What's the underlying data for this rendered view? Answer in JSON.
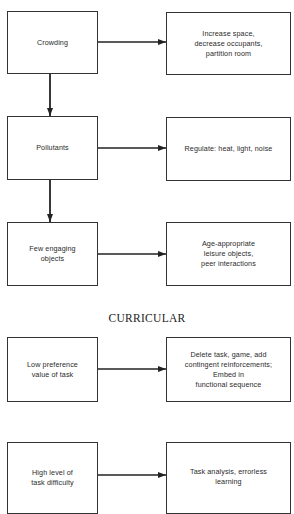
{
  "diagram": {
    "section_heading": "CURRICULAR",
    "environmental_rows": [
      {
        "problem": "Crowding",
        "intervention": "Increase space,\ndecrease occupants,\npartition room"
      },
      {
        "problem": "Pollutants",
        "intervention": "Regulate:  heat, light, noise"
      },
      {
        "problem": "Few engaging\nobjects",
        "intervention": "Age-appropriate\nleisure objects,\npeer interactions"
      }
    ],
    "curricular_rows": [
      {
        "problem": "Low preference\nvalue of task",
        "intervention": "Delete task, game, add\ncontingent reinforcements;\nEmbed in\nfunctional sequence"
      },
      {
        "problem": "High level of\ntask difficulty",
        "intervention": "Task analysis, errorless\nlearning"
      }
    ],
    "colors": {
      "line": "#222222",
      "border": "#333333",
      "background": "#ffffff"
    }
  }
}
